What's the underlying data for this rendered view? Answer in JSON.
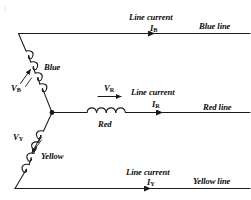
{
  "figure": {
    "type": "circuit-diagram",
    "background_color": "#ffffff",
    "stroke_color": "#1a1a1a"
  },
  "phases": [
    {
      "id": "blue",
      "winding_label": "Blue",
      "voltage_label": "V",
      "voltage_subscript": "B",
      "line_current_caption": "Line current",
      "current_label": "I",
      "current_subscript": "B",
      "line_label": "Blue line"
    },
    {
      "id": "red",
      "winding_label": "Red",
      "voltage_label": "V",
      "voltage_subscript": "R",
      "line_current_caption": "Line current",
      "current_label": "I",
      "current_subscript": "R",
      "line_label": "Red line"
    },
    {
      "id": "yellow",
      "winding_label": "Yellow",
      "voltage_label": "V",
      "voltage_subscript": "Y",
      "line_current_caption": "Line current",
      "current_label": "I",
      "current_subscript": "Y",
      "line_label": "Yellow line"
    }
  ],
  "labels": {
    "blue_winding": "Blue",
    "red_winding": "Red",
    "yellow_winding": "Yellow",
    "blue_line": "Blue line",
    "red_line": "Red line",
    "yellow_line": "Yellow line",
    "line_current_top": "Line current",
    "line_current_mid": "Line current",
    "line_current_bottom": "Line current",
    "v_b": "V",
    "v_b_sub": "B",
    "v_r": "V",
    "v_r_sub": "R",
    "v_y": "V",
    "v_y_sub": "Y",
    "i_b": "I",
    "i_b_sub": "B",
    "i_r": "I",
    "i_r_sub": "R",
    "i_y": "I",
    "i_y_sub": "Y"
  }
}
